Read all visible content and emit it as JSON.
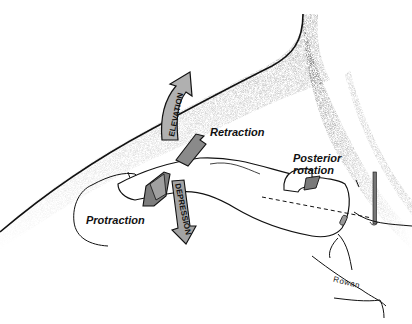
{
  "diagram": {
    "type": "anatomical-illustration",
    "labels": {
      "elevation": "ELEVATION",
      "depression": "DEPRESSION",
      "retraction": "Retraction",
      "protraction": "Protraction",
      "posterior_rotation_line1": "Posterior",
      "posterior_rotation_line2": "rotation",
      "signature": "Rowan"
    },
    "colors": {
      "arrow_fill": "#8a8a8a",
      "arrow_light": "#b5b5b5",
      "outline": "#111111",
      "shading": "#9a9a9a",
      "background": "#ffffff"
    }
  }
}
